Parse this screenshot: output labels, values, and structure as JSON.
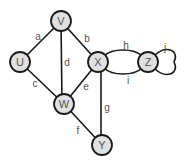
{
  "graph": {
    "nodes": [
      {
        "id": "U",
        "label": "U",
        "x": 20,
        "y": 62
      },
      {
        "id": "V",
        "label": "V",
        "x": 61,
        "y": 21
      },
      {
        "id": "X",
        "label": "X",
        "x": 98,
        "y": 62
      },
      {
        "id": "Z",
        "label": "Z",
        "x": 148,
        "y": 62
      },
      {
        "id": "W",
        "label": "W",
        "x": 64,
        "y": 104
      },
      {
        "id": "Y",
        "label": "Y",
        "x": 102,
        "y": 145
      }
    ],
    "edges": [
      {
        "id": "a",
        "label": "a",
        "from": "U",
        "to": "V"
      },
      {
        "id": "b",
        "label": "b",
        "from": "V",
        "to": "X"
      },
      {
        "id": "c",
        "label": "c",
        "from": "U",
        "to": "W"
      },
      {
        "id": "d",
        "label": "d",
        "from": "V",
        "to": "W"
      },
      {
        "id": "e",
        "label": "e",
        "from": "W",
        "to": "X"
      },
      {
        "id": "f",
        "label": "f",
        "from": "W",
        "to": "Y"
      },
      {
        "id": "g",
        "label": "g",
        "from": "X",
        "to": "Y"
      },
      {
        "id": "h",
        "label": "h",
        "from": "X",
        "to": "Z"
      },
      {
        "id": "i",
        "label": "i",
        "from": "X",
        "to": "Z"
      },
      {
        "id": "j",
        "label": "j",
        "from": "Z",
        "to": "Z"
      }
    ],
    "colors": {
      "node_fill": "#e0e0e0",
      "stroke": "#1a1a1a",
      "text": "#555555"
    }
  }
}
